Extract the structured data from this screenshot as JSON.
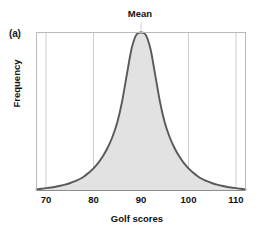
{
  "figure": {
    "panel_letter": "(a)",
    "annotation": "Mean",
    "frame_color": "#b9b9b9",
    "grid_color": "#cfcfcf",
    "curve_color": "#595959",
    "fill_color": "#e2e2e2",
    "text_color": "#111111"
  },
  "chart_data": {
    "type": "area",
    "title": "",
    "annotations": [
      {
        "label": "Mean",
        "x": 90
      }
    ],
    "xlabel": "Golf scores",
    "ylabel": "Frequency",
    "xlim": [
      68,
      112
    ],
    "ylim": [
      0,
      1
    ],
    "xticks": [
      70,
      80,
      90,
      100,
      110
    ],
    "xticklabels": [
      "70",
      "80",
      "90",
      "100",
      "110"
    ],
    "yticks": [],
    "yticklabels": [],
    "grid": "vertical",
    "legend": "none",
    "series": [
      {
        "name": "Golf score distribution",
        "description": "Symmetric heavy-tailed (leptokurtic) frequency curve centered on the mean of 90",
        "x": [
          68,
          69,
          70,
          71,
          72,
          73,
          74,
          75,
          76,
          77,
          78,
          79,
          80,
          81,
          82,
          83,
          84,
          85,
          86,
          87,
          88,
          89,
          90,
          91,
          92,
          93,
          94,
          95,
          96,
          97,
          98,
          99,
          100,
          101,
          102,
          103,
          104,
          105,
          106,
          107,
          108,
          109,
          110,
          111,
          112
        ],
        "values": [
          0.008,
          0.011,
          0.015,
          0.019,
          0.024,
          0.03,
          0.037,
          0.046,
          0.057,
          0.071,
          0.089,
          0.112,
          0.14,
          0.175,
          0.218,
          0.272,
          0.34,
          0.43,
          0.56,
          0.73,
          0.895,
          0.985,
          1.0,
          0.985,
          0.895,
          0.73,
          0.56,
          0.43,
          0.34,
          0.272,
          0.218,
          0.175,
          0.14,
          0.112,
          0.089,
          0.071,
          0.057,
          0.046,
          0.037,
          0.03,
          0.024,
          0.019,
          0.015,
          0.011,
          0.008
        ]
      }
    ]
  }
}
